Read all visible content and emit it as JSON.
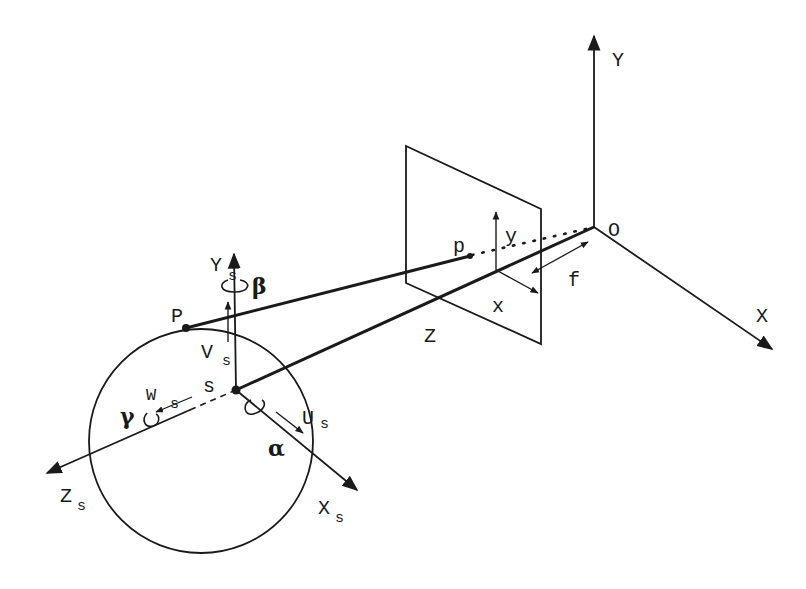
{
  "diagram": {
    "type": "camera-projection-geometry",
    "colors": {
      "ink": "#1a1a1a",
      "background": "#ffffff"
    },
    "world_axes": {
      "origin": {
        "label": "O",
        "x": 594,
        "y": 227
      },
      "x_axis": {
        "label": "X",
        "tip": [
          774,
          350
        ]
      },
      "y_axis": {
        "label": "Y",
        "tip": [
          594,
          33
        ]
      }
    },
    "image_plane": {
      "corners": [
        [
          406,
          146
        ],
        [
          541,
          209
        ],
        [
          541,
          344
        ],
        [
          406,
          283
        ]
      ],
      "principal_point": [
        496,
        270
      ],
      "x_label": "x",
      "y_label": "y",
      "focal_label": "f",
      "image_point_label": "p",
      "image_point": [
        470,
        256
      ]
    },
    "optical_axis_label": "Z",
    "sphere": {
      "center": [
        201,
        441
      ],
      "radius": 112,
      "center_label": "s",
      "center_point": [
        236,
        390
      ],
      "surface_point_label": "P",
      "surface_point": [
        186,
        328
      ]
    },
    "sphere_axes": {
      "xs": {
        "label": "X",
        "sub": "s",
        "tip": [
          360,
          492
        ]
      },
      "ys": {
        "label": "Y",
        "sub": "s",
        "tip": [
          234,
          251
        ]
      },
      "zs": {
        "label": "Z",
        "sub": "s",
        "tip": [
          44,
          474
        ]
      }
    },
    "velocities": {
      "u": {
        "label": "U",
        "sub": "s"
      },
      "v": {
        "label": "V",
        "sub": "s"
      },
      "w": {
        "label": "W",
        "sub": "s"
      }
    },
    "rotations": {
      "alpha": "α",
      "beta": "β",
      "gamma": "γ"
    }
  }
}
